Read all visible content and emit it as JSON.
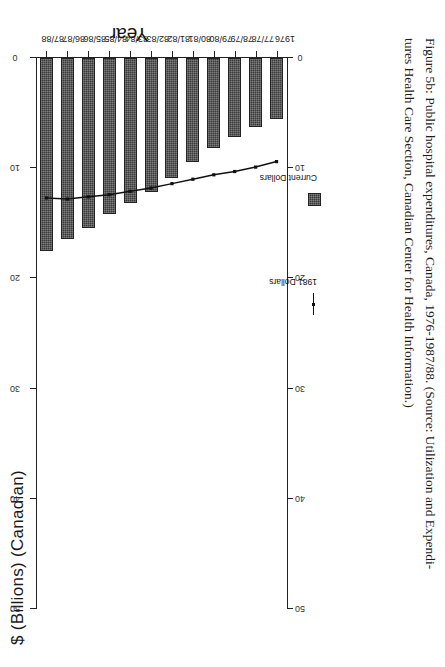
{
  "figure": {
    "caption_line1": "Figure 5b: Public hospital expenditures, Canada, 1976-1987/88. (Source: Utilization and Expendi-",
    "caption_line2": "tures Health Care Section, Canadian Center for Health Information.)"
  },
  "legend": {
    "line_label": "1981 Dollars",
    "bar_label": "Current Dollars"
  },
  "chart_data": {
    "type": "bar",
    "title": "",
    "orientation": "horizontal",
    "xlabel": "Year",
    "ylabel": "$ (Billions) (Canadian)",
    "ylim": [
      0,
      50
    ],
    "yticks": [
      50,
      40,
      30,
      20,
      10,
      0
    ],
    "ytick_labels": [
      "50",
      "40",
      "30",
      "20",
      "10",
      "0"
    ],
    "grid": false,
    "legend_position": "below-axis",
    "categories": [
      "1976",
      "77/78",
      "78/79",
      "79/80",
      "80/81",
      "81/82",
      "82/83",
      "83/84",
      "84/85",
      "85/86",
      "86/87",
      "87/88"
    ],
    "series": [
      {
        "name": "Current Dollars",
        "type": "bar",
        "values": [
          5.5,
          6.3,
          7.2,
          8.2,
          9.4,
          10.9,
          12.2,
          13.2,
          14.2,
          15.4,
          16.4,
          17.5
        ]
      },
      {
        "name": "1981 Dollars",
        "type": "line",
        "values": [
          9.4,
          9.9,
          10.3,
          10.6,
          11.0,
          11.4,
          11.8,
          12.1,
          12.4,
          12.6,
          12.8,
          12.7
        ]
      }
    ]
  }
}
